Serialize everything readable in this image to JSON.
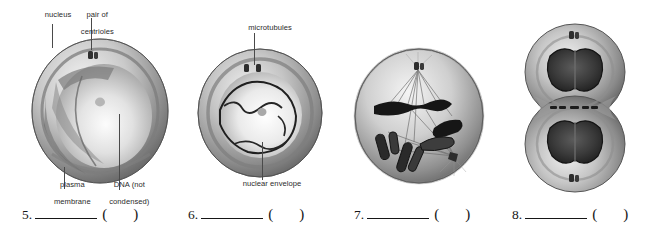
{
  "figure": {
    "panels": [
      {
        "id": "panel-1",
        "stage_number": "5",
        "labels": [
          {
            "name": "nucleus",
            "text": "nucleus",
            "lines": [
              "nucleus"
            ]
          },
          {
            "name": "pair-of-centrioles",
            "text": "pair of centrioles",
            "lines": [
              "pair of",
              "centrioles"
            ]
          },
          {
            "name": "plasma-membrane",
            "text": "plasma membrane",
            "lines": [
              "plasma",
              "membrane"
            ]
          },
          {
            "name": "dna-not-condensed",
            "text": "DNA (not condensed)",
            "lines": [
              "DNA (not",
              "condensed)"
            ]
          }
        ]
      },
      {
        "id": "panel-2",
        "stage_number": "6",
        "labels": [
          {
            "name": "microtubules",
            "text": "microtubules",
            "lines": [
              "microtubules"
            ]
          },
          {
            "name": "nuclear-envelope",
            "text": "nuclear envelope",
            "lines": [
              "nuclear envelope"
            ]
          }
        ]
      },
      {
        "id": "panel-3",
        "stage_number": "7",
        "labels": []
      },
      {
        "id": "panel-4",
        "stage_number": "8",
        "labels": []
      }
    ]
  },
  "answers": {
    "items": [
      {
        "number": "5.",
        "blank": "",
        "paren_open": "(",
        "paren_close": ")",
        "answer": ""
      },
      {
        "number": "6.",
        "blank": "",
        "paren_open": "(",
        "paren_close": ")",
        "answer": ""
      },
      {
        "number": "7.",
        "blank": "",
        "paren_open": "(",
        "paren_close": ")",
        "answer": ""
      },
      {
        "number": "8.",
        "blank": "",
        "paren_open": "(",
        "paren_close": ")",
        "answer": ""
      }
    ]
  },
  "colors": {
    "background": "#ffffff",
    "text": "#1a1a1a",
    "label_text": "#2b2b2b",
    "leader_line": "#4a4a4a",
    "cell_dark": "#4e4e4e",
    "cell_mid": "#8d8d8d",
    "cell_light": "#dcdcdc",
    "chromosome": "#1e1e1e"
  }
}
